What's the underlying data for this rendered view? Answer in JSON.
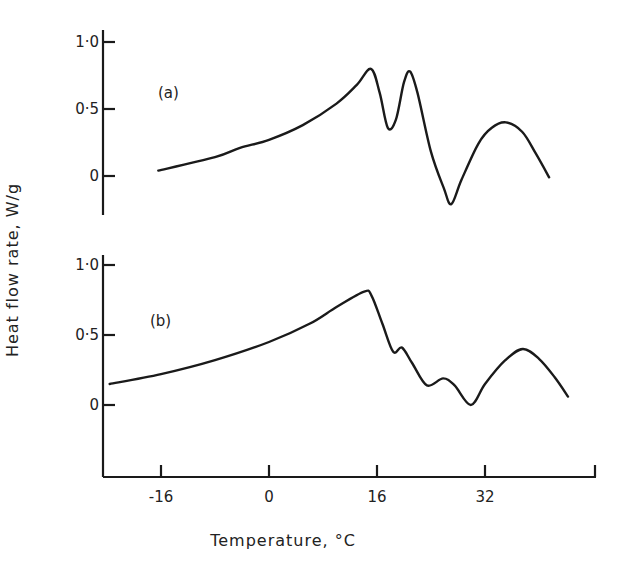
{
  "chart_data": {
    "type": "line",
    "xlabel": "Temperature, °C",
    "ylabel": "Heat flow rate, W/g",
    "xlim": [
      -25,
      48
    ],
    "x_ticks": [
      -16,
      0,
      16,
      32
    ],
    "x_tick_labels": [
      "-16",
      "0",
      "16",
      "32"
    ],
    "grid": false,
    "legend": "none",
    "panels": [
      {
        "label": "(a)",
        "ylim": [
          -0.3,
          1.0
        ],
        "y_ticks": [
          0,
          0.5,
          1.0
        ],
        "y_tick_labels": [
          "0",
          "0·5",
          "1·0"
        ],
        "series": [
          {
            "name": "(a)",
            "x": [
              -16.4,
              -8,
              -4.3,
              0,
              5,
              10,
              13,
              15.1,
              16.4,
              17.6,
              18.8,
              20.0,
              20.9,
              22.0,
              24.0,
              25.9,
              27.0,
              28.5,
              31.0,
              33.0,
              35.1,
              37.5,
              39.5,
              41.5
            ],
            "y": [
              0.04,
              0.14,
              0.21,
              0.27,
              0.38,
              0.54,
              0.68,
              0.8,
              0.62,
              0.36,
              0.42,
              0.7,
              0.78,
              0.62,
              0.18,
              -0.09,
              -0.21,
              -0.03,
              0.24,
              0.36,
              0.4,
              0.33,
              0.17,
              -0.01
            ]
          }
        ]
      },
      {
        "label": "(b)",
        "ylim": [
          -0.5,
          1.0
        ],
        "y_ticks": [
          0,
          0.5,
          1.0
        ],
        "y_tick_labels": [
          "0",
          "0·5",
          "1·0"
        ],
        "series": [
          {
            "name": "(b)",
            "x": [
              -23.6,
              -16,
              -8,
              0,
              6,
              10,
              14.1,
              15.2,
              16.8,
              18.4,
              19.7,
              21.2,
              23.4,
              25.8,
              27.5,
              29.9,
              32.0,
              35.0,
              37.6,
              40.0,
              42.3,
              44.3
            ],
            "y": [
              0.15,
              0.22,
              0.32,
              0.45,
              0.58,
              0.7,
              0.81,
              0.78,
              0.58,
              0.38,
              0.41,
              0.3,
              0.14,
              0.19,
              0.14,
              0.0,
              0.15,
              0.32,
              0.4,
              0.33,
              0.2,
              0.06
            ]
          }
        ]
      }
    ]
  }
}
